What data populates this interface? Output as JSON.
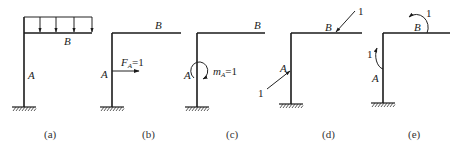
{
  "figure": {
    "panels": [
      {
        "id": "a",
        "caption": "(a)",
        "label_B": "B",
        "label_A": "A",
        "load": "uniform distributed load on beam"
      },
      {
        "id": "b",
        "caption": "(b)",
        "label_B": "B",
        "label_A": "A",
        "force_label": "F",
        "force_sub": "A",
        "force_eq": "=1"
      },
      {
        "id": "c",
        "caption": "(c)",
        "label_B": "B",
        "label_A": "A",
        "moment_label": "m",
        "moment_sub": "A",
        "moment_eq": "=1"
      },
      {
        "id": "d",
        "caption": "(d)",
        "label_B": "B",
        "label_A": "A",
        "force_B_value": "1",
        "force_A_value": "1"
      },
      {
        "id": "e",
        "caption": "(e)",
        "label_B": "B",
        "label_A": "A",
        "moment_B_value": "1",
        "moment_A_value": "1"
      }
    ]
  }
}
